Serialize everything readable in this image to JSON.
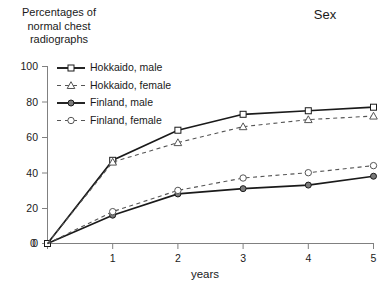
{
  "titles": {
    "y_axis_title": "Percentages of\nnormal chest\nradiographs",
    "x_axis_title": "years",
    "legend_group_title": "Sex"
  },
  "axes": {
    "y_ticks": [
      "0",
      "20",
      "40",
      "60",
      "80",
      "100"
    ],
    "x_ticks": [
      "0",
      "1",
      "2",
      "3",
      "4",
      "5"
    ]
  },
  "legend": {
    "entries": [
      {
        "label": "Hokkaido, male",
        "marker": "open-square",
        "line": "solid",
        "color": "#1a1a1a"
      },
      {
        "label": "Hokkaido, female",
        "marker": "open-triangle",
        "line": "dashed",
        "color": "#4d4d4d"
      },
      {
        "label": "Finland, male",
        "marker": "filled-circle",
        "line": "solid",
        "color": "#1a1a1a"
      },
      {
        "label": "Finland, female",
        "marker": "open-circle",
        "line": "dashed",
        "color": "#4d4d4d"
      }
    ]
  },
  "chart_data": {
    "type": "line",
    "title": "Percentages of normal chest radiographs",
    "xlabel": "years",
    "ylabel": "Percentages of normal chest radiographs",
    "xlim": [
      0,
      5
    ],
    "ylim": [
      0,
      100
    ],
    "grid": false,
    "legend_position": "upper-left-inside",
    "legend_title": "Sex",
    "x": [
      0,
      1,
      2,
      3,
      4,
      5
    ],
    "series": [
      {
        "name": "Hokkaido, male",
        "marker": "open-square",
        "linestyle": "solid",
        "values": [
          0,
          47,
          64,
          73,
          75,
          77
        ]
      },
      {
        "name": "Hokkaido, female",
        "marker": "open-triangle",
        "linestyle": "dashed",
        "values": [
          0,
          46,
          57,
          66,
          70,
          72
        ]
      },
      {
        "name": "Finland, male",
        "marker": "filled-circle",
        "linestyle": "solid",
        "values": [
          0,
          16,
          28,
          31,
          33,
          38
        ]
      },
      {
        "name": "Finland, female",
        "marker": "open-circle",
        "linestyle": "dashed",
        "values": [
          0,
          18,
          30,
          37,
          40,
          44
        ]
      }
    ]
  }
}
